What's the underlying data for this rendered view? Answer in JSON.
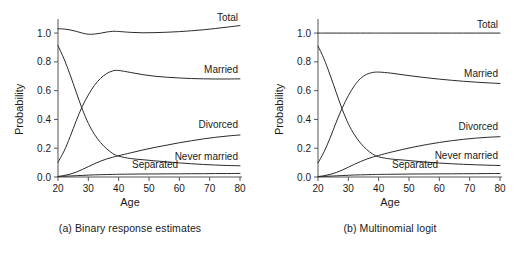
{
  "figure": {
    "panels": [
      {
        "id": "a",
        "caption": "(a) Binary response estimates",
        "xlabel": "Age",
        "ylabel": "Probability",
        "xticks": [
          "20",
          "30",
          "40",
          "50",
          "60",
          "70",
          "80"
        ],
        "yticks": [
          "0.0",
          "0.2",
          "0.4",
          "0.6",
          "0.8",
          "1.0"
        ],
        "labels": {
          "total": "Total",
          "married": "Married",
          "divorced": "Divorced",
          "never_married": "Never married",
          "separated": "Separated"
        }
      },
      {
        "id": "b",
        "caption": "(b) Multinomial logit",
        "xlabel": "Age",
        "ylabel": "Probability",
        "xticks": [
          "20",
          "30",
          "40",
          "50",
          "60",
          "70",
          "80"
        ],
        "yticks": [
          "0.0",
          "0.2",
          "0.4",
          "0.6",
          "0.8",
          "1.0"
        ],
        "labels": {
          "total": "Total",
          "married": "Married",
          "divorced": "Divorced",
          "never_married": "Never married",
          "separated": "Separated"
        }
      }
    ]
  },
  "chart_data": [
    {
      "type": "line",
      "title": "(a) Binary response estimates",
      "xlabel": "Age",
      "ylabel": "Probability",
      "xlim": [
        20,
        80
      ],
      "ylim": [
        0.0,
        1.07
      ],
      "grid": false,
      "legend": "inline-right",
      "x": [
        20,
        22,
        24,
        26,
        28,
        30,
        32,
        34,
        36,
        38,
        40,
        44,
        48,
        52,
        56,
        60,
        64,
        68,
        72,
        76,
        80
      ],
      "series": [
        {
          "name": "Total",
          "values": [
            1.03,
            1.028,
            1.022,
            1.012,
            1.0,
            0.992,
            0.993,
            0.999,
            1.007,
            1.012,
            1.011,
            1.005,
            1.002,
            1.003,
            1.006,
            1.01,
            1.016,
            1.023,
            1.032,
            1.042,
            1.052
          ]
        },
        {
          "name": "Married",
          "values": [
            0.103,
            0.18,
            0.28,
            0.39,
            0.49,
            0.57,
            0.636,
            0.685,
            0.718,
            0.737,
            0.74,
            0.726,
            0.711,
            0.7,
            0.693,
            0.688,
            0.684,
            0.682,
            0.681,
            0.681,
            0.682
          ]
        },
        {
          "name": "Never married",
          "values": [
            0.912,
            0.82,
            0.71,
            0.59,
            0.472,
            0.373,
            0.297,
            0.24,
            0.197,
            0.164,
            0.145,
            0.128,
            0.12,
            0.112,
            0.105,
            0.098,
            0.092,
            0.087,
            0.083,
            0.08,
            0.078
          ]
        },
        {
          "name": "Divorced",
          "values": [
            0.004,
            0.01,
            0.02,
            0.034,
            0.052,
            0.072,
            0.092,
            0.11,
            0.125,
            0.137,
            0.148,
            0.168,
            0.188,
            0.206,
            0.222,
            0.238,
            0.252,
            0.265,
            0.276,
            0.285,
            0.292
          ]
        },
        {
          "name": "Separated",
          "values": [
            0.003,
            0.005,
            0.007,
            0.009,
            0.011,
            0.013,
            0.015,
            0.016,
            0.017,
            0.018,
            0.019,
            0.02,
            0.021,
            0.021,
            0.022,
            0.022,
            0.023,
            0.023,
            0.024,
            0.024,
            0.025
          ]
        }
      ]
    },
    {
      "type": "line",
      "title": "(b) Multinomial logit",
      "xlabel": "Age",
      "ylabel": "Probability",
      "xlim": [
        20,
        80
      ],
      "ylim": [
        0.0,
        1.07
      ],
      "grid": false,
      "legend": "inline-right",
      "x": [
        20,
        22,
        24,
        26,
        28,
        30,
        32,
        34,
        36,
        38,
        40,
        44,
        48,
        52,
        56,
        60,
        64,
        68,
        72,
        76,
        80
      ],
      "series": [
        {
          "name": "Total",
          "values": [
            1.0,
            1.0,
            1.0,
            1.0,
            1.0,
            1.0,
            1.0,
            1.0,
            1.0,
            1.0,
            1.0,
            1.0,
            1.0,
            1.0,
            1.0,
            1.0,
            1.0,
            1.0,
            1.0,
            1.0,
            1.0
          ]
        },
        {
          "name": "Married",
          "values": [
            0.098,
            0.175,
            0.272,
            0.38,
            0.48,
            0.565,
            0.634,
            0.684,
            0.713,
            0.726,
            0.729,
            0.722,
            0.71,
            0.699,
            0.689,
            0.68,
            0.672,
            0.665,
            0.659,
            0.654,
            0.65
          ]
        },
        {
          "name": "Never married",
          "values": [
            0.91,
            0.82,
            0.708,
            0.588,
            0.47,
            0.37,
            0.294,
            0.236,
            0.192,
            0.16,
            0.14,
            0.125,
            0.118,
            0.11,
            0.103,
            0.097,
            0.092,
            0.088,
            0.085,
            0.082,
            0.08
          ]
        },
        {
          "name": "Divorced",
          "values": [
            0.003,
            0.009,
            0.018,
            0.031,
            0.048,
            0.068,
            0.088,
            0.107,
            0.124,
            0.138,
            0.15,
            0.172,
            0.192,
            0.21,
            0.226,
            0.24,
            0.252,
            0.262,
            0.27,
            0.276,
            0.28
          ]
        },
        {
          "name": "Separated",
          "values": [
            0.002,
            0.004,
            0.006,
            0.008,
            0.01,
            0.012,
            0.014,
            0.015,
            0.016,
            0.017,
            0.018,
            0.019,
            0.02,
            0.021,
            0.021,
            0.022,
            0.022,
            0.023,
            0.023,
            0.024,
            0.024
          ]
        }
      ]
    }
  ],
  "style": {
    "line_color": "#2b2b2b",
    "axis_color": "#555555",
    "background": "#ffffff"
  }
}
